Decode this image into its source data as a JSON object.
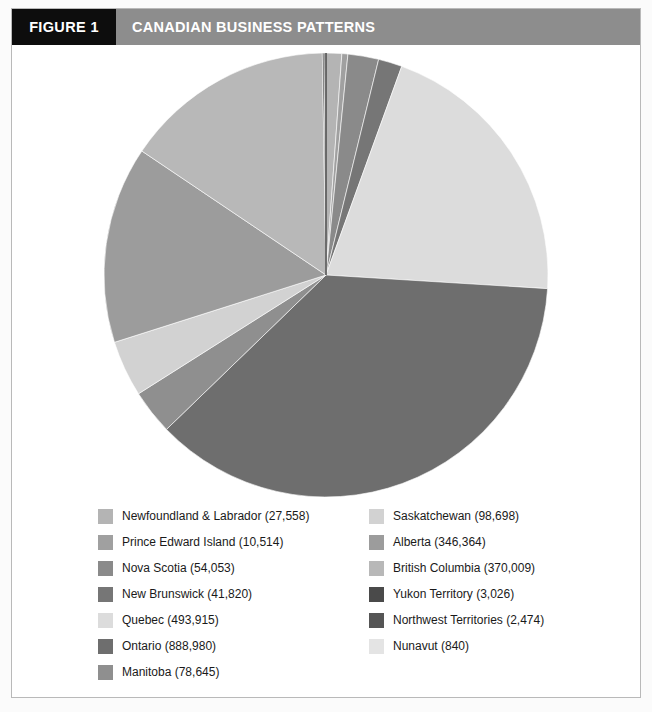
{
  "header": {
    "figure_number": "FIGURE 1",
    "title": "CANADIAN BUSINESS PATTERNS",
    "number_box_color": "#0d0d0d",
    "title_box_color": "#8d8d8d",
    "text_color": "#ffffff"
  },
  "chart_data": {
    "type": "pie",
    "title": "CANADIAN BUSINESS PATTERNS",
    "xlabel": "",
    "ylabel": "",
    "legend_position": "bottom",
    "grid": false,
    "total": 2416896,
    "start_angle_deg": -90,
    "direction": "clockwise",
    "categories": [
      "Newfoundland & Labrador",
      "Prince Edward Island",
      "Nova Scotia",
      "New Brunswick",
      "Quebec",
      "Ontario",
      "Manitoba",
      "Saskatchewan",
      "Alberta",
      "British Columbia",
      "Yukon Territory",
      "Northwest Territories",
      "Nunavut"
    ],
    "values": [
      27558,
      10514,
      54053,
      41820,
      493915,
      888980,
      78645,
      98698,
      346364,
      370009,
      3026,
      2474,
      840
    ],
    "colors": [
      "#b4b4b4",
      "#a0a0a0",
      "#8a8a8a",
      "#767676",
      "#dcdcdc",
      "#6e6e6e",
      "#8f8f8f",
      "#d2d2d2",
      "#9c9c9c",
      "#b8b8b8",
      "#4a4a4a",
      "#555555",
      "#e4e4e4"
    ],
    "slices": [
      {
        "label": "Newfoundland & Labrador",
        "value": 27558,
        "value_text": "27,558",
        "color": "#b4b4b4"
      },
      {
        "label": "Prince Edward Island",
        "value": 10514,
        "value_text": "10,514",
        "color": "#a0a0a0"
      },
      {
        "label": "Nova Scotia",
        "value": 54053,
        "value_text": "54,053",
        "color": "#8a8a8a"
      },
      {
        "label": "New Brunswick",
        "value": 41820,
        "value_text": "41,820",
        "color": "#767676"
      },
      {
        "label": "Quebec",
        "value": 493915,
        "value_text": "493,915",
        "color": "#dcdcdc"
      },
      {
        "label": "Ontario",
        "value": 888980,
        "value_text": "888,980",
        "color": "#6e6e6e"
      },
      {
        "label": "Manitoba",
        "value": 78645,
        "value_text": "78,645",
        "color": "#8f8f8f"
      },
      {
        "label": "Saskatchewan",
        "value": 98698,
        "value_text": "98,698",
        "color": "#d2d2d2"
      },
      {
        "label": "Alberta",
        "value": 346364,
        "value_text": "346,364",
        "color": "#9c9c9c"
      },
      {
        "label": "British Columbia",
        "value": 370009,
        "value_text": "370,009",
        "color": "#b8b8b8"
      },
      {
        "label": "Yukon Territory",
        "value": 3026,
        "value_text": "3,026",
        "color": "#4a4a4a"
      },
      {
        "label": "Northwest Territories",
        "value": 2474,
        "value_text": "2,474",
        "color": "#555555"
      },
      {
        "label": "Nunavut",
        "value": 840,
        "value_text": "840",
        "color": "#e4e4e4"
      }
    ]
  },
  "legend": {
    "left_column": [
      {
        "label": "Newfoundland & Labrador (27,558)",
        "color": "#b4b4b4"
      },
      {
        "label": "Prince Edward Island (10,514)",
        "color": "#a0a0a0"
      },
      {
        "label": "Nova Scotia (54,053)",
        "color": "#8a8a8a"
      },
      {
        "label": "New Brunswick (41,820)",
        "color": "#767676"
      },
      {
        "label": "Quebec (493,915)",
        "color": "#dcdcdc"
      },
      {
        "label": "Ontario (888,980)",
        "color": "#6e6e6e"
      },
      {
        "label": "Manitoba (78,645)",
        "color": "#8f8f8f"
      }
    ],
    "right_column": [
      {
        "label": "Saskatchewan (98,698)",
        "color": "#d2d2d2"
      },
      {
        "label": "Alberta (346,364)",
        "color": "#9c9c9c"
      },
      {
        "label": "British Columbia (370,009)",
        "color": "#b8b8b8"
      },
      {
        "label": "Yukon Territory (3,026)",
        "color": "#4a4a4a"
      },
      {
        "label": "Northwest Territories (2,474)",
        "color": "#555555"
      },
      {
        "label": "Nunavut (840)",
        "color": "#e4e4e4"
      }
    ]
  }
}
